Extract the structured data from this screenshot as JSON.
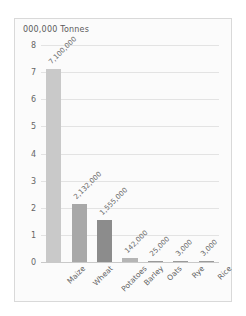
{
  "chart_data": {
    "type": "bar",
    "title": "000,000 Tonnes",
    "xlabel": "",
    "ylabel": "",
    "ylim": [
      0,
      8
    ],
    "ytick_labels": [
      "0",
      "1",
      "2",
      "3",
      "4",
      "5",
      "6",
      "7",
      "8"
    ],
    "yticks": [
      0,
      1,
      2,
      3,
      4,
      5,
      6,
      7,
      8
    ],
    "grid": true,
    "legend": "none",
    "units_note": "values in tonnes; axis in millions of tonnes",
    "categories": [
      "Maize",
      "Wheat",
      "Potatoes",
      "Barley",
      "Oats",
      "Rye",
      "Rice"
    ],
    "values": [
      7.1,
      2.132,
      1.555,
      0.142,
      0.025,
      0.003,
      0.003
    ],
    "data_labels": [
      "7,100,000",
      "2,132,000",
      "1,555,000",
      "142,000",
      "25,000",
      "3,000",
      "3,000"
    ],
    "bar_colors": [
      "#c9c9c9",
      "#a8a8a8",
      "#8c8c8c",
      "#b5b5b5",
      "#9a9a9a",
      "#9a9a9a",
      "#9a9a9a"
    ]
  },
  "colors": {
    "panel_background": "#fbfbfb",
    "panel_border": "#d9d9d9",
    "gridline": "#e3e3e3",
    "baseline": "#c9c9c9",
    "text": "#5f5f5f"
  }
}
